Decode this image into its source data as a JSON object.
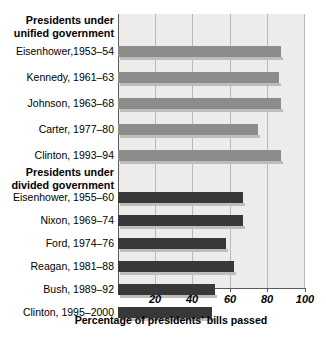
{
  "chart_data": {
    "type": "bar",
    "orientation": "horizontal",
    "title": "",
    "xlabel": "Percentage of presidents' bills passed",
    "ylabel": "",
    "xlim": [
      0,
      100
    ],
    "xticks": [
      20,
      40,
      60,
      80,
      100
    ],
    "xticklabels": [
      "20",
      "40",
      "60",
      "80",
      "100"
    ],
    "grid": true,
    "grid_axis": "x",
    "legend": "none",
    "groups": [
      {
        "heading_line1": "Presidents under",
        "heading_line2": "unified government",
        "color": "#8c8c8a",
        "categories": [
          "Eisenhower,1953–54",
          "Kennedy, 1961–63",
          "Johnson, 1963–68",
          "Carter, 1977–80",
          "Clinton, 1993–94"
        ],
        "values": [
          87,
          86,
          87,
          75,
          87
        ]
      },
      {
        "heading_line1": "Presidents under",
        "heading_line2": "divided government",
        "color": "#383838",
        "categories": [
          "Eisenhower, 1955–60",
          "Nixon, 1969–74",
          "Ford, 1974–76",
          "Reagan, 1981–88",
          "Bush, 1989–92",
          "Clinton, 1995–2000"
        ],
        "values": [
          67,
          67,
          58,
          62,
          52,
          50
        ]
      }
    ]
  },
  "colors": {
    "unified_bar": "#8c8c8a",
    "divided_bar": "#383838",
    "plot_background": "#ececea",
    "gridline": "#b9b9b7",
    "axis": "#5a5a5a",
    "text": "#000000"
  }
}
